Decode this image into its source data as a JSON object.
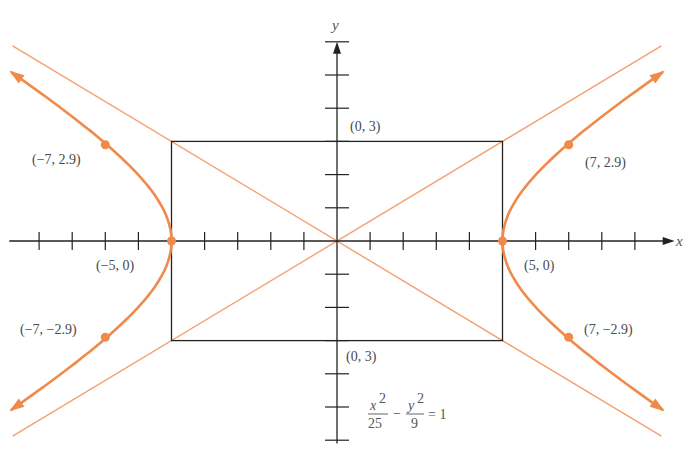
{
  "chart_data": {
    "type": "line",
    "title": "",
    "xlabel": "x",
    "ylabel": "y",
    "xlim": [
      -10,
      10
    ],
    "ylim": [
      -6,
      6
    ],
    "grid": false,
    "x_ticks": [
      -9,
      -8,
      -7,
      -6,
      -5,
      -4,
      -3,
      -2,
      -1,
      1,
      2,
      3,
      4,
      5,
      6,
      7,
      8,
      9
    ],
    "y_ticks": [
      -6,
      -5,
      -4,
      -3,
      -2,
      -1,
      1,
      2,
      3,
      4,
      5,
      6
    ],
    "equation": {
      "x_term_num": "x",
      "x_term_exp": "2",
      "x_term_den": "25",
      "minus": "−",
      "y_term_num": "y",
      "y_term_exp": "2",
      "y_term_den": "9",
      "rhs": "= 1"
    },
    "hyperbola": {
      "a": 5,
      "b": 3,
      "color": "#f08a4b"
    },
    "asymptotes": [
      {
        "name": "y = 3x/5",
        "slope": 0.6
      },
      {
        "name": "y = -3x/5",
        "slope": -0.6
      }
    ],
    "asymptote_color": "#f4a070",
    "rectangle": {
      "x": [
        -5,
        5
      ],
      "y": [
        -3,
        3
      ],
      "color": "#222222"
    },
    "points": [
      {
        "x": -7,
        "y": 2.9,
        "label": "(−7, 2.9)"
      },
      {
        "x": 7,
        "y": 2.9,
        "label": "(7, 2.9)"
      },
      {
        "x": -7,
        "y": -2.9,
        "label": "(−7, −2.9)"
      },
      {
        "x": 7,
        "y": -2.9,
        "label": "(7, −2.9)"
      },
      {
        "x": -5,
        "y": 0,
        "label": "(−5, 0)"
      },
      {
        "x": 5,
        "y": 0,
        "label": "(5, 0)"
      }
    ],
    "rect_labels": [
      {
        "x": 0,
        "y": 3,
        "label": "(0, 3)"
      },
      {
        "x": 0,
        "y": -3,
        "label": "(0, 3)"
      }
    ]
  }
}
